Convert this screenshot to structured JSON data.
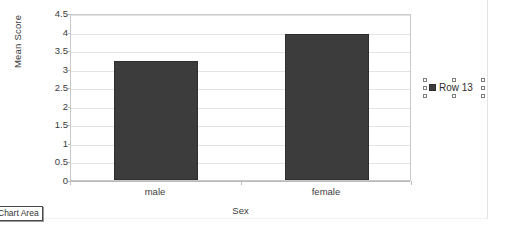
{
  "chart_data": {
    "type": "bar",
    "title": "",
    "subtitle": "",
    "categories": [
      "male",
      "female"
    ],
    "values": [
      3.2,
      3.93
    ],
    "series": [
      {
        "name": "Row 13",
        "values": [
          3.2,
          3.93
        ]
      }
    ],
    "xlabel": "Sex",
    "ylabel": "Mean Score",
    "ylim": [
      0,
      4.5
    ],
    "ytick_values": [
      "4.5",
      "4",
      "3.5",
      "3",
      "2.5",
      "2",
      "1.5",
      "1",
      "0.5",
      "0"
    ],
    "ytick_step": 0.5,
    "grid": true,
    "legend_position": "right",
    "bar_color": "#3c3c3c",
    "gridline_color": "#e3e3e3",
    "plot_border_color": "#c8c8c8"
  },
  "legend": {
    "entries": [
      {
        "label": "Row 13",
        "color": "#3c3c3c"
      }
    ],
    "selected": true
  },
  "tooltip": {
    "text": "Chart Area"
  }
}
